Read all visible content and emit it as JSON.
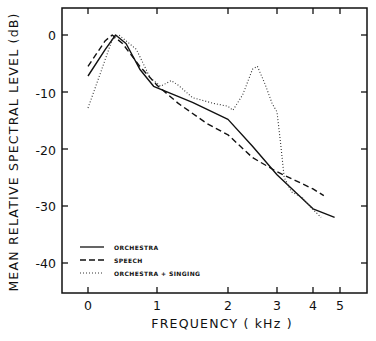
{
  "chart_data": {
    "type": "line",
    "title": "",
    "xlabel": "FREQUENCY (kHz)",
    "ylabel": "MEAN RELATIVE SPECTRAL LEVEL (dB)",
    "x_ticks": [
      0,
      1,
      2,
      3,
      4,
      5
    ],
    "x_tick_labels": [
      "0",
      "1",
      "2",
      "3",
      "4",
      "5"
    ],
    "x_scale": "nonlinear (compressed above 2 kHz)",
    "y_ticks": [
      0,
      -10,
      -20,
      -30,
      -40
    ],
    "y_tick_labels": [
      "0",
      "-10",
      "-20",
      "-30",
      "-40"
    ],
    "ylim": [
      -45,
      4
    ],
    "grid": false,
    "legend_position": "lower-left",
    "series": [
      {
        "name": "ORCHESTRA",
        "style": "solid",
        "x": [
          0,
          0.25,
          0.4,
          0.55,
          0.75,
          0.95,
          1.2,
          1.5,
          2.0,
          2.5,
          3.0,
          3.5,
          4.0,
          4.8
        ],
        "values": [
          -7.2,
          -2.5,
          0,
          -1.5,
          -6,
          -9,
          -10.3,
          -11.8,
          -14.8,
          -19.5,
          -24.5,
          -27.5,
          -30.5,
          -32
        ]
      },
      {
        "name": "SPEECH",
        "style": "dashed",
        "x": [
          0,
          0.25,
          0.35,
          0.5,
          0.75,
          1.0,
          1.3,
          1.7,
          2.0,
          2.5,
          3.0,
          3.5,
          4.0,
          4.4
        ],
        "values": [
          -5.5,
          -1,
          0,
          -1.5,
          -5.5,
          -8.8,
          -12,
          -15.5,
          -17.5,
          -21.5,
          -24,
          -25.5,
          -27,
          -28.2
        ]
      },
      {
        "name": "ORCHESTRA + SINGING",
        "style": "dotted",
        "x": [
          0,
          0.2,
          0.35,
          0.45,
          0.7,
          0.9,
          1.05,
          1.2,
          1.3,
          1.5,
          1.8,
          2.0,
          2.1,
          2.3,
          2.5,
          2.6,
          2.75,
          2.9,
          3.0,
          3.1,
          3.2,
          3.4,
          3.7,
          3.9,
          4.3
        ],
        "values": [
          -12.8,
          -6,
          -0.8,
          0,
          -2.5,
          -7.5,
          -9,
          -8,
          -8.8,
          -11,
          -12,
          -12.5,
          -13.2,
          -10.5,
          -6,
          -5.5,
          -8.5,
          -12,
          -13.5,
          -19,
          -25,
          -27.5,
          -28.5,
          -30,
          -32
        ]
      }
    ]
  },
  "axes": {
    "xlabel": "FREQUENCY  ( kHz )",
    "ylabel": "MEAN RELATIVE  SPECTRAL LEVEL  (dB)"
  },
  "legend": [
    {
      "label": "ORCHESTRA",
      "style": "solid"
    },
    {
      "label": "SPEECH",
      "style": "dashed"
    },
    {
      "label": "ORCHESTRA + SINGING",
      "style": "dotted"
    }
  ]
}
